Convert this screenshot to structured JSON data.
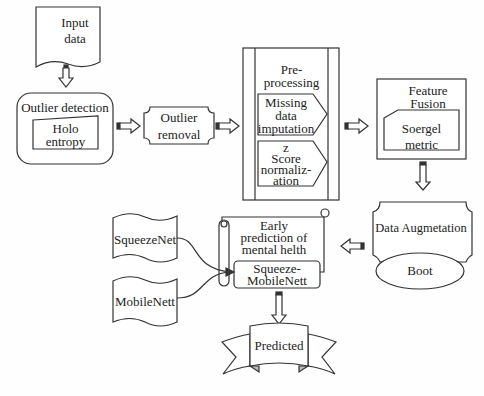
{
  "diagram": {
    "nodes": {
      "input_data": {
        "line1": "Input",
        "line2": "data"
      },
      "outlier_detection": {
        "title": "Outlier detection",
        "sub_line1": "Holo",
        "sub_line2": "entropy"
      },
      "outlier_removal": {
        "line1": "Outlier",
        "line2": "removal"
      },
      "preprocessing": {
        "title_line1": "Pre-",
        "title_line2": "processing",
        "step1": {
          "line1": "Missing",
          "line2": "data",
          "line3": "imputation"
        },
        "step2": {
          "line1": "z",
          "line2": "Score",
          "line3": "normaliz-",
          "line4": "ation"
        }
      },
      "feature_fusion": {
        "title_line1": "Feature",
        "title_line2": "Fusion",
        "sub_line1": "Soergel",
        "sub_line2": "metric"
      },
      "data_augmentation": {
        "title": "Data Augmetation",
        "sub": "Boot"
      },
      "early_prediction": {
        "line1": "Early",
        "line2": "prediction of",
        "line3": "mental helth",
        "model_line1": "Squeeze-",
        "model_line2": "MobileNett"
      },
      "squeezenet": {
        "label": "SqueezeNet"
      },
      "mobilenett": {
        "label": "MobileNett"
      },
      "predicted": {
        "label": "Predicted"
      }
    },
    "edges": [
      [
        "input_data",
        "outlier_detection"
      ],
      [
        "outlier_detection",
        "outlier_removal"
      ],
      [
        "outlier_removal",
        "preprocessing"
      ],
      [
        "preprocessing",
        "feature_fusion"
      ],
      [
        "feature_fusion",
        "data_augmentation"
      ],
      [
        "data_augmentation",
        "early_prediction"
      ],
      [
        "squeezenet",
        "early_prediction"
      ],
      [
        "mobilenett",
        "early_prediction"
      ],
      [
        "early_prediction",
        "predicted"
      ]
    ],
    "colors": {
      "stroke": "#333333",
      "background": "#fefefe",
      "ribbon_fold": "#bbbbbb"
    }
  }
}
